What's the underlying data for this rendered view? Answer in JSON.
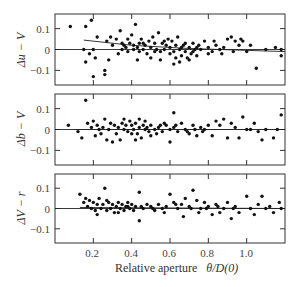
{
  "chart_data": [
    {
      "type": "scatter",
      "panel": "top",
      "title": "",
      "xlabel": "",
      "ylabel": "Δu − V",
      "xlim": [
        0.0,
        1.2
      ],
      "ylim": [
        -0.17,
        0.17
      ],
      "yticks": [
        0.1,
        0,
        -0.1
      ],
      "ytick_labels": [
        "0.1",
        "0",
        "−0.1"
      ],
      "xticks": [
        0.2,
        0.4,
        0.6,
        0.8,
        1.0
      ],
      "zero_line": true,
      "fit_line": [
        [
          0.15,
          0.045
        ],
        [
          0.4,
          0.02
        ],
        [
          0.7,
          0.005
        ],
        [
          1.2,
          -0.01
        ]
      ],
      "points": [
        [
          0.08,
          0.11
        ],
        [
          0.16,
          0.11
        ],
        [
          0.19,
          0.14
        ],
        [
          0.2,
          0.0
        ],
        [
          0.22,
          0.06
        ],
        [
          0.15,
          0.0
        ],
        [
          0.16,
          -0.06
        ],
        [
          0.18,
          -0.02
        ],
        [
          0.21,
          -0.04
        ],
        [
          0.2,
          -0.13
        ],
        [
          0.26,
          -0.12
        ],
        [
          0.26,
          -0.1
        ],
        [
          0.27,
          0.04
        ],
        [
          0.29,
          0.06
        ],
        [
          0.3,
          0.02
        ],
        [
          0.32,
          0.05
        ],
        [
          0.34,
          0.09
        ],
        [
          0.35,
          0.03
        ],
        [
          0.36,
          0.02
        ],
        [
          0.37,
          0.01
        ],
        [
          0.38,
          0.05
        ],
        [
          0.39,
          0.03
        ],
        [
          0.4,
          0.07
        ],
        [
          0.41,
          0.02
        ],
        [
          0.42,
          0.12
        ],
        [
          0.43,
          0.01
        ],
        [
          0.44,
          0.03
        ],
        [
          0.45,
          0.05
        ],
        [
          0.46,
          0.0
        ],
        [
          0.47,
          0.02
        ],
        [
          0.48,
          -0.02
        ],
        [
          0.49,
          0.04
        ],
        [
          0.5,
          0.01
        ],
        [
          0.51,
          0.06
        ],
        [
          0.52,
          0.03
        ],
        [
          0.53,
          0.0
        ],
        [
          0.54,
          0.08
        ],
        [
          0.55,
          -0.01
        ],
        [
          0.56,
          0.03
        ],
        [
          0.57,
          0.0
        ],
        [
          0.58,
          0.02
        ],
        [
          0.59,
          0.05
        ],
        [
          0.6,
          0.01
        ],
        [
          0.61,
          0.04
        ],
        [
          0.62,
          -0.01
        ],
        [
          0.63,
          0.02
        ],
        [
          0.64,
          0.06
        ],
        [
          0.65,
          0.0
        ],
        [
          0.66,
          -0.03
        ],
        [
          0.67,
          0.02
        ],
        [
          0.68,
          -0.01
        ],
        [
          0.69,
          -0.04
        ],
        [
          0.7,
          0.01
        ],
        [
          0.71,
          -0.02
        ],
        [
          0.72,
          0.03
        ],
        [
          0.73,
          0.0
        ],
        [
          0.74,
          -0.03
        ],
        [
          0.75,
          0.02
        ],
        [
          0.76,
          0.0
        ],
        [
          0.78,
          0.04
        ],
        [
          0.8,
          0.01
        ],
        [
          0.82,
          -0.01
        ],
        [
          0.84,
          0.02
        ],
        [
          0.86,
          0.0
        ],
        [
          0.88,
          0.01
        ],
        [
          0.9,
          0.05
        ],
        [
          0.92,
          0.06
        ],
        [
          0.94,
          0.04
        ],
        [
          0.96,
          0.02
        ],
        [
          0.98,
          0.04
        ],
        [
          1.0,
          -0.01
        ],
        [
          1.02,
          0.02
        ],
        [
          1.05,
          -0.09
        ],
        [
          1.1,
          0.0
        ],
        [
          1.15,
          0.01
        ],
        [
          1.18,
          -0.03
        ],
        [
          1.18,
          0.0
        ],
        [
          0.43,
          -0.05
        ],
        [
          0.5,
          -0.04
        ],
        [
          0.28,
          -0.05
        ],
        [
          0.33,
          -0.02
        ],
        [
          0.55,
          -0.05
        ],
        [
          0.62,
          -0.07
        ],
        [
          0.65,
          -0.06
        ],
        [
          0.7,
          -0.05
        ],
        [
          0.35,
          0.0
        ],
        [
          0.38,
          -0.01
        ],
        [
          0.41,
          0.0
        ],
        [
          0.44,
          -0.01
        ],
        [
          0.46,
          0.03
        ],
        [
          0.52,
          -0.01
        ],
        [
          0.57,
          0.04
        ],
        [
          0.6,
          -0.02
        ],
        [
          0.63,
          -0.04
        ],
        [
          0.66,
          0.01
        ],
        [
          0.68,
          0.03
        ],
        [
          0.72,
          -0.01
        ],
        [
          0.74,
          0.01
        ],
        [
          0.8,
          -0.02
        ],
        [
          0.83,
          0.04
        ],
        [
          0.87,
          -0.02
        ],
        [
          0.93,
          -0.01
        ],
        [
          0.97,
          0.05
        ]
      ]
    },
    {
      "type": "scatter",
      "panel": "middle",
      "ylabel": "Δb − V",
      "xlim": [
        0.0,
        1.2
      ],
      "ylim": [
        -0.17,
        0.17
      ],
      "yticks": [
        0.1,
        0,
        -0.1
      ],
      "ytick_labels": [
        "0.1",
        "0",
        "−0.1"
      ],
      "xticks": [
        0.2,
        0.4,
        0.6,
        0.8,
        1.0
      ],
      "zero_line": true,
      "fit_line": [
        [
          0.1,
          0.0
        ],
        [
          1.2,
          0.0
        ]
      ],
      "points": [
        [
          0.07,
          0.02
        ],
        [
          0.12,
          -0.01
        ],
        [
          0.16,
          0.14
        ],
        [
          0.14,
          -0.04
        ],
        [
          0.17,
          0.03
        ],
        [
          0.19,
          0.01
        ],
        [
          0.2,
          0.04
        ],
        [
          0.21,
          -0.03
        ],
        [
          0.22,
          0.02
        ],
        [
          0.23,
          0.0
        ],
        [
          0.24,
          -0.02
        ],
        [
          0.25,
          0.01
        ],
        [
          0.26,
          0.05
        ],
        [
          0.27,
          -0.05
        ],
        [
          0.28,
          0.0
        ],
        [
          0.29,
          0.03
        ],
        [
          0.3,
          -0.06
        ],
        [
          0.31,
          0.02
        ],
        [
          0.32,
          -0.02
        ],
        [
          0.33,
          0.01
        ],
        [
          0.34,
          -0.05
        ],
        [
          0.35,
          0.03
        ],
        [
          0.36,
          0.0
        ],
        [
          0.37,
          0.02
        ],
        [
          0.38,
          -0.01
        ],
        [
          0.39,
          0.04
        ],
        [
          0.4,
          0.02
        ],
        [
          0.41,
          0.0
        ],
        [
          0.42,
          0.03
        ],
        [
          0.43,
          -0.02
        ],
        [
          0.44,
          0.01
        ],
        [
          0.45,
          -0.04
        ],
        [
          0.46,
          0.02
        ],
        [
          0.47,
          0.0
        ],
        [
          0.48,
          0.01
        ],
        [
          0.49,
          -0.01
        ],
        [
          0.5,
          0.02
        ],
        [
          0.52,
          0.0
        ],
        [
          0.54,
          0.01
        ],
        [
          0.56,
          -0.01
        ],
        [
          0.58,
          0.02
        ],
        [
          0.6,
          0.0
        ],
        [
          0.62,
          0.01
        ],
        [
          0.64,
          -0.01
        ],
        [
          0.66,
          0.03
        ],
        [
          0.68,
          0.0
        ],
        [
          0.7,
          -0.02
        ],
        [
          0.72,
          0.02
        ],
        [
          0.74,
          -0.03
        ],
        [
          0.76,
          0.01
        ],
        [
          0.78,
          0.0
        ],
        [
          0.8,
          0.02
        ],
        [
          0.82,
          -0.03
        ],
        [
          0.84,
          0.04
        ],
        [
          0.86,
          0.02
        ],
        [
          0.88,
          0.05
        ],
        [
          0.9,
          -0.04
        ],
        [
          0.92,
          0.03
        ],
        [
          0.94,
          0.01
        ],
        [
          0.96,
          -0.04
        ],
        [
          0.98,
          0.06
        ],
        [
          1.0,
          0.0
        ],
        [
          1.02,
          0.0
        ],
        [
          1.04,
          0.03
        ],
        [
          1.06,
          -0.01
        ],
        [
          1.08,
          -0.05
        ],
        [
          1.1,
          0.0
        ],
        [
          1.14,
          -0.04
        ],
        [
          1.16,
          0.0
        ],
        [
          1.18,
          0.07
        ],
        [
          0.62,
          0.08
        ],
        [
          0.6,
          -0.06
        ],
        [
          0.42,
          -0.05
        ],
        [
          0.36,
          0.05
        ],
        [
          0.47,
          0.04
        ],
        [
          0.53,
          -0.02
        ],
        [
          0.57,
          0.03
        ],
        [
          0.63,
          0.02
        ],
        [
          0.69,
          -0.01
        ],
        [
          0.73,
          0.0
        ],
        [
          0.77,
          -0.01
        ],
        [
          0.4,
          -0.02
        ],
        [
          0.44,
          0.05
        ],
        [
          0.5,
          -0.03
        ],
        [
          0.55,
          0.02
        ]
      ]
    },
    {
      "type": "scatter",
      "panel": "bottom",
      "ylabel": "ΔV − r",
      "xlabel": "Relative aperture θ/D(0)",
      "xlim": [
        0.0,
        1.2
      ],
      "ylim": [
        -0.17,
        0.17
      ],
      "yticks": [
        0.1,
        0,
        -0.1
      ],
      "ytick_labels": [
        "0.1",
        "0",
        "−0.1"
      ],
      "xticks": [
        0.2,
        0.4,
        0.6,
        0.8,
        1.0
      ],
      "xtick_labels": [
        "0.2",
        "0.4",
        "0.6",
        "0.8",
        "1.0"
      ],
      "zero_line": true,
      "fit_line": [
        [
          0.13,
          0.005
        ],
        [
          1.2,
          0.0
        ]
      ],
      "points": [
        [
          0.13,
          0.07
        ],
        [
          0.15,
          0.03
        ],
        [
          0.16,
          0.05
        ],
        [
          0.17,
          0.01
        ],
        [
          0.18,
          0.04
        ],
        [
          0.19,
          0.0
        ],
        [
          0.2,
          0.03
        ],
        [
          0.21,
          -0.01
        ],
        [
          0.22,
          0.02
        ],
        [
          0.23,
          0.05
        ],
        [
          0.24,
          0.0
        ],
        [
          0.25,
          0.02
        ],
        [
          0.26,
          0.1
        ],
        [
          0.27,
          -0.01
        ],
        [
          0.28,
          0.03
        ],
        [
          0.29,
          0.0
        ],
        [
          0.3,
          0.02
        ],
        [
          0.31,
          -0.02
        ],
        [
          0.32,
          0.01
        ],
        [
          0.33,
          0.03
        ],
        [
          0.34,
          0.0
        ],
        [
          0.35,
          0.02
        ],
        [
          0.36,
          -0.01
        ],
        [
          0.37,
          0.01
        ],
        [
          0.38,
          0.03
        ],
        [
          0.39,
          0.0
        ],
        [
          0.4,
          0.02
        ],
        [
          0.41,
          -0.01
        ],
        [
          0.42,
          0.01
        ],
        [
          0.44,
          0.08
        ],
        [
          0.44,
          -0.06
        ],
        [
          0.46,
          0.0
        ],
        [
          0.48,
          0.02
        ],
        [
          0.5,
          0.01
        ],
        [
          0.52,
          -0.01
        ],
        [
          0.54,
          0.02
        ],
        [
          0.56,
          0.0
        ],
        [
          0.58,
          0.01
        ],
        [
          0.6,
          0.07
        ],
        [
          0.62,
          0.03
        ],
        [
          0.64,
          0.0
        ],
        [
          0.66,
          0.02
        ],
        [
          0.68,
          0.05
        ],
        [
          0.7,
          0.01
        ],
        [
          0.72,
          0.09
        ],
        [
          0.74,
          0.04
        ],
        [
          0.76,
          0.0
        ],
        [
          0.78,
          0.03
        ],
        [
          0.8,
          0.01
        ],
        [
          0.82,
          -0.03
        ],
        [
          0.84,
          0.02
        ],
        [
          0.86,
          -0.02
        ],
        [
          0.88,
          0.0
        ],
        [
          0.9,
          0.03
        ],
        [
          0.92,
          -0.05
        ],
        [
          0.94,
          0.01
        ],
        [
          0.96,
          -0.02
        ],
        [
          1.0,
          0.06
        ],
        [
          1.02,
          0.0
        ],
        [
          1.04,
          -0.03
        ],
        [
          1.06,
          0.02
        ],
        [
          1.08,
          0.06
        ],
        [
          1.1,
          0.0
        ],
        [
          1.12,
          0.01
        ],
        [
          1.14,
          -0.02
        ],
        [
          1.17,
          0.03
        ],
        [
          1.18,
          0.0
        ],
        [
          0.22,
          -0.03
        ],
        [
          0.27,
          0.04
        ],
        [
          0.33,
          -0.02
        ],
        [
          0.38,
          0.01
        ],
        [
          0.45,
          0.01
        ],
        [
          0.51,
          0.0
        ],
        [
          0.57,
          -0.02
        ],
        [
          0.63,
          0.02
        ],
        [
          0.67,
          -0.04
        ],
        [
          0.71,
          0.0
        ],
        [
          0.75,
          -0.02
        ],
        [
          0.79,
          0.0
        ],
        [
          0.85,
          0.01
        ],
        [
          0.93,
          0.0
        ]
      ]
    }
  ],
  "axis": {
    "xtick_labels": [
      "0.2",
      "0.4",
      "0.6",
      "0.8",
      "1.0"
    ],
    "ytick_labels": [
      "0.1",
      "0",
      "−0.1"
    ],
    "xlabel_prefix": "Relative aperture",
    "xlabel_math": "θ/D(0)"
  },
  "panels": {
    "top": {
      "ylabel": "Δu − V"
    },
    "middle": {
      "ylabel": "Δb − V"
    },
    "bottom": {
      "ylabel": "ΔV − r"
    }
  }
}
